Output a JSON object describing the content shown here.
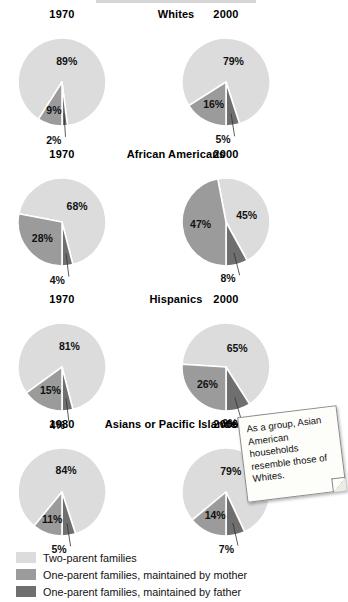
{
  "colors": {
    "two_parent": "#dcdcdc",
    "mother": "#9b9b9b",
    "father": "#6f6f6f",
    "background": "#ffffff",
    "text": "#111111",
    "note_paper": "#fdfdfa",
    "note_border": "#8a8a8a"
  },
  "legend": {
    "items": [
      {
        "swatch": "two_parent",
        "label": "Two-parent families"
      },
      {
        "swatch": "mother",
        "label": "One-parent families, maintained by mother"
      },
      {
        "swatch": "father",
        "label": "One-parent families, maintained by father"
      }
    ]
  },
  "note": {
    "text": "As a group, Asian American households resemble those of Whites."
  },
  "chart_data": {
    "type": "pie",
    "title": "",
    "series_names": [
      "Two-parent families",
      "One-parent families, maintained by mother",
      "One-parent families, maintained by father"
    ],
    "legend_position": "bottom-left",
    "value_suffix": "%",
    "groups": [
      {
        "group_label": "Whites",
        "charts": [
          {
            "year": "1970",
            "slices": [
              {
                "series": "Two-parent families",
                "value": 89,
                "label": "89%"
              },
              {
                "series": "One-parent families, maintained by mother",
                "value": 9,
                "label": "9%"
              },
              {
                "series": "One-parent families, maintained by father",
                "value": 2,
                "label": "2%"
              }
            ]
          },
          {
            "year": "2000",
            "slices": [
              {
                "series": "Two-parent families",
                "value": 79,
                "label": "79%"
              },
              {
                "series": "One-parent families, maintained by mother",
                "value": 16,
                "label": "16%"
              },
              {
                "series": "One-parent families, maintained by father",
                "value": 5,
                "label": "5%"
              }
            ]
          }
        ]
      },
      {
        "group_label": "African Americans",
        "charts": [
          {
            "year": "1970",
            "slices": [
              {
                "series": "Two-parent families",
                "value": 68,
                "label": "68%"
              },
              {
                "series": "One-parent families, maintained by mother",
                "value": 28,
                "label": "28%"
              },
              {
                "series": "One-parent families, maintained by father",
                "value": 4,
                "label": "4%"
              }
            ]
          },
          {
            "year": "2000",
            "slices": [
              {
                "series": "Two-parent families",
                "value": 45,
                "label": "45%"
              },
              {
                "series": "One-parent families, maintained by mother",
                "value": 47,
                "label": "47%"
              },
              {
                "series": "One-parent families, maintained by father",
                "value": 8,
                "label": "8%"
              }
            ]
          }
        ]
      },
      {
        "group_label": "Hispanics",
        "charts": [
          {
            "year": "1970",
            "slices": [
              {
                "series": "Two-parent families",
                "value": 81,
                "label": "81%"
              },
              {
                "series": "One-parent families, maintained by mother",
                "value": 15,
                "label": "15%"
              },
              {
                "series": "One-parent families, maintained by father",
                "value": 4,
                "label": "4%"
              }
            ]
          },
          {
            "year": "2000",
            "slices": [
              {
                "series": "Two-parent families",
                "value": 65,
                "label": "65%"
              },
              {
                "series": "One-parent families, maintained by mother",
                "value": 26,
                "label": "26%"
              },
              {
                "series": "One-parent families, maintained by father",
                "value": 9,
                "label": "9%"
              }
            ]
          }
        ]
      },
      {
        "group_label": "Asians or Pacific Islanders",
        "charts": [
          {
            "year": "1980",
            "slices": [
              {
                "series": "Two-parent families",
                "value": 84,
                "label": "84%"
              },
              {
                "series": "One-parent families, maintained by mother",
                "value": 11,
                "label": "11%"
              },
              {
                "series": "One-parent families, maintained by father",
                "value": 5,
                "label": "5%"
              }
            ]
          },
          {
            "year": "2000",
            "slices": [
              {
                "series": "Two-parent families",
                "value": 79,
                "label": "79%"
              },
              {
                "series": "One-parent families, maintained by mother",
                "value": 14,
                "label": "14%"
              },
              {
                "series": "One-parent families, maintained by father",
                "value": 7,
                "label": "7%"
              }
            ]
          }
        ]
      }
    ]
  }
}
